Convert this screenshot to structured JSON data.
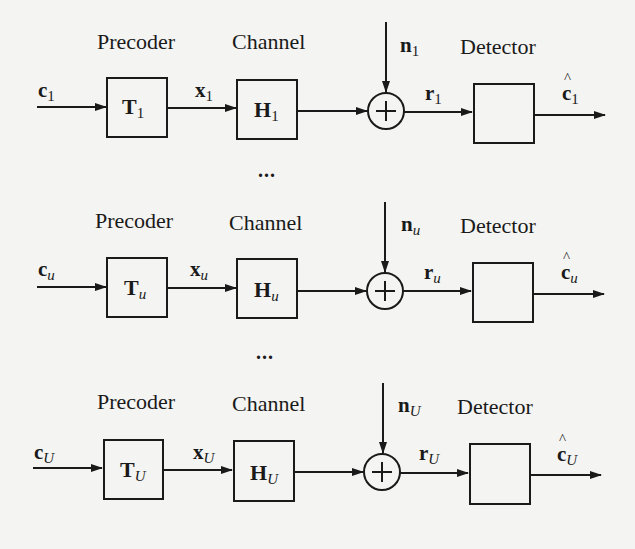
{
  "diagram": {
    "type": "multi-user precoding block diagram",
    "labels": {
      "precoder": "Precoder",
      "channel": "Channel",
      "detector": "Detector",
      "adder_symbol": "+"
    },
    "ellipsis": "...",
    "rows": [
      {
        "index_label": "1",
        "index_italic": false,
        "input": "c",
        "precoder_box": "T",
        "precoded_signal": "x",
        "channel_box": "H",
        "noise": "n",
        "received": "r",
        "output": "c",
        "output_hat": true
      },
      {
        "index_label": "u",
        "index_italic": true,
        "input": "c",
        "precoder_box": "T",
        "precoded_signal": "x",
        "channel_box": "H",
        "noise": "n",
        "received": "r",
        "output": "c",
        "output_hat": true
      },
      {
        "index_label": "U",
        "index_italic": true,
        "input": "c",
        "precoder_box": "T",
        "precoded_signal": "x",
        "channel_box": "H",
        "noise": "n",
        "received": "r",
        "output": "c",
        "output_hat": true
      }
    ],
    "colors": {
      "background": "#f4f4f2",
      "stroke": "#1a1a1a"
    }
  }
}
